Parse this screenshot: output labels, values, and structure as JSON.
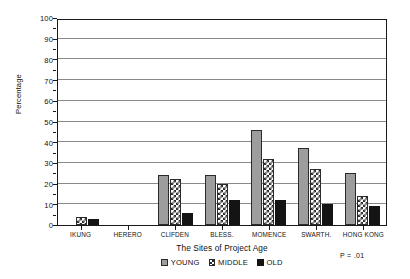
{
  "chart_data": {
    "type": "bar",
    "title": "",
    "subtitle": "",
    "xlabel": "The Sites of Project Age",
    "ylabel": "Percentage",
    "ylim": [
      0,
      100
    ],
    "ytick_values": [
      0,
      10,
      20,
      30,
      40,
      50,
      60,
      70,
      80,
      90,
      100
    ],
    "ytick_labels": [
      "0",
      "10",
      "20",
      "30",
      "40",
      "50",
      "60",
      "70",
      "80",
      "90",
      "100"
    ],
    "grid": true,
    "legend_position": "bottom-center",
    "categories": [
      "IKUNG",
      "HERERO",
      "CLIFDEN",
      "BLESS.",
      "MOMENCE",
      "SWARTH.",
      "HONG KONG"
    ],
    "series": [
      {
        "name": "YOUNG",
        "color": "#9d9d9d",
        "fill": "solid-gray",
        "values": [
          0,
          0,
          24,
          24,
          46,
          37,
          25
        ]
      },
      {
        "name": "MIDDLE",
        "color": "#ffffff",
        "fill": "checkered",
        "values": [
          4,
          0,
          22,
          20,
          32,
          27,
          14
        ]
      },
      {
        "name": "OLD",
        "color": "#141414",
        "fill": "solid-black",
        "values": [
          3,
          0,
          6,
          12,
          12,
          10,
          9
        ]
      }
    ],
    "annotations": [
      {
        "text": "P = .01",
        "position": "below-right-axis"
      }
    ]
  },
  "axes": {
    "y": {
      "label": "Percentage"
    },
    "x": {
      "label": "The Sites of Project Age"
    }
  },
  "legend": {
    "items": [
      {
        "label": "YOUNG"
      },
      {
        "label": "MIDDLE"
      },
      {
        "label": "OLD"
      }
    ]
  },
  "annotation": {
    "p_value": "P = .01"
  },
  "colors": {
    "young": "#9d9d9d",
    "middle": "#ffffff",
    "old": "#141414",
    "axis": "#1a1a1a",
    "grid": "#8a8a8a"
  }
}
